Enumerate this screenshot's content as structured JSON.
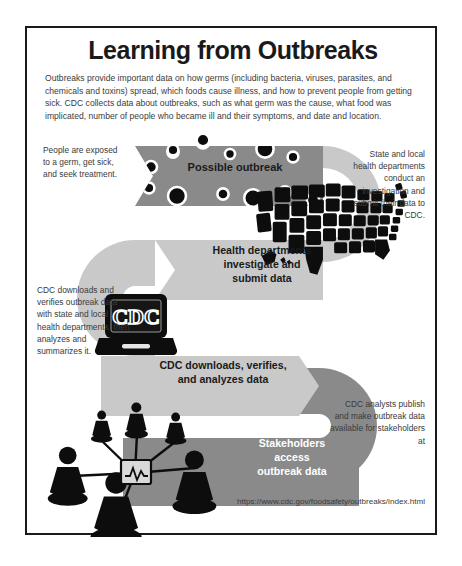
{
  "page": {
    "title": "Learning from Outbreaks",
    "intro": "Outbreaks provide important data on how germs (including bacteria, viruses, parasites, and chemicals and toxins) spread, which foods cause illness, and how to prevent people from getting sick. CDC collects data about outbreaks, such as what germ was the cause, what food was implicated, number of people who became ill and their symptoms, and date and location.",
    "url": "https://www.cdc.gov/foodsafety/outbreaks/index.html"
  },
  "colors": {
    "band_dark": "#8a8a8a",
    "band_light": "#c9c9c9",
    "frame": "#1a1a1a",
    "text": "#3b3b3b",
    "label_dark": "#1a1a1a",
    "label_light": "#ffffff",
    "art_black": "#0d0d0d"
  },
  "flow": {
    "steps": [
      {
        "id": "step-1",
        "band_label": "Possible outbreak",
        "band_tone": "dark",
        "caption": "People are exposed to a germ, get sick, and seek treatment.",
        "caption_side": "left",
        "icon": "germ-dots-icon"
      },
      {
        "id": "step-2",
        "band_label": "Health departments investigate and submit data",
        "band_tone": "light",
        "caption": "State and local health departments conduct an investigation and submit their data to CDC.",
        "caption_side": "right",
        "icon": "us-map-icon"
      },
      {
        "id": "step-3",
        "band_label": "CDC downloads, verifies, and analyzes data",
        "band_tone": "light",
        "caption": "CDC downloads and verifies outbreak data with state and local health departments, then analyzes and summarizes it.",
        "caption_side": "left",
        "icon": "cdc-laptop-icon"
      },
      {
        "id": "step-4",
        "band_label": "Stakeholders access outbreak data",
        "band_tone": "dark",
        "caption": "CDC analysts publish and make outbreak data available for stakeholders at",
        "caption_side": "right",
        "icon": "stakeholders-network-icon"
      }
    ]
  },
  "labels": {
    "band1_line1": "Possible outbreak",
    "band2_line1": "Health departments",
    "band2_line2": "investigate and",
    "band2_line3": "submit data",
    "band3_line1": "CDC downloads, verifies,",
    "band3_line2": "and analyzes data",
    "band4_line1": "Stakeholders",
    "band4_line2": "access",
    "band4_line3": "outbreak data"
  },
  "captions": {
    "left1": "People are exposed to a germ, get sick, and seek treatment.",
    "right1": "State and local health departments conduct an investigation and submit their data to CDC.",
    "left2": "CDC downloads and verifies outbreak data with state and local health departments, then analyzes and summarizes it.",
    "right2": "CDC analysts publish and make outbreak data available for stakeholders at"
  },
  "art": {
    "laptop_text": "CDC"
  }
}
